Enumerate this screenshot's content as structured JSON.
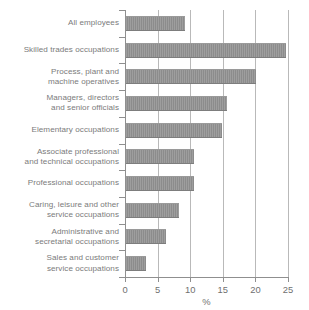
{
  "chart_data": {
    "type": "bar",
    "orientation": "horizontal",
    "title": "",
    "xlabel": "%",
    "ylabel": "",
    "xlim": [
      0,
      25
    ],
    "xticks": [
      0,
      5,
      10,
      15,
      20,
      25
    ],
    "grid": "vertical",
    "legend": "none",
    "bar_color": "#8c8c8c",
    "categories": [
      "All employees",
      "Skilled trades occupations",
      "Process, plant and machine operatives",
      "Managers, directors and senior officials",
      "Elementary occupations",
      "Associate professional and technical occupations",
      "Professional occupations",
      "Caring, leisure and other service occupations",
      "Administrative and secretarial occupations",
      "Sales and customer service occupations"
    ],
    "values": [
      9.0,
      24.5,
      20.0,
      15.5,
      14.8,
      10.4,
      10.4,
      8.1,
      6.1,
      3.0
    ]
  },
  "rows": [
    {
      "label_lines": [
        "All employees"
      ],
      "value": 9.0
    },
    {
      "label_lines": [
        "Skilled trades occupations"
      ],
      "value": 24.5
    },
    {
      "label_lines": [
        "Process, plant and",
        "machine operatives"
      ],
      "value": 20.0
    },
    {
      "label_lines": [
        "Managers, directors",
        "and senior officials"
      ],
      "value": 15.5
    },
    {
      "label_lines": [
        "Elementary occupations"
      ],
      "value": 14.8
    },
    {
      "label_lines": [
        "Associate professional",
        "and technical occupations"
      ],
      "value": 10.4
    },
    {
      "label_lines": [
        "Professional occupations"
      ],
      "value": 10.4
    },
    {
      "label_lines": [
        "Caring, leisure and other",
        "service occupations"
      ],
      "value": 8.1
    },
    {
      "label_lines": [
        "Administrative and",
        "secretarial occupations"
      ],
      "value": 6.1
    },
    {
      "label_lines": [
        "Sales and customer",
        "service occupations"
      ],
      "value": 3.0
    }
  ],
  "axis": {
    "tick_labels": [
      "0",
      "5",
      "10",
      "15",
      "20",
      "25"
    ],
    "title": "%"
  }
}
